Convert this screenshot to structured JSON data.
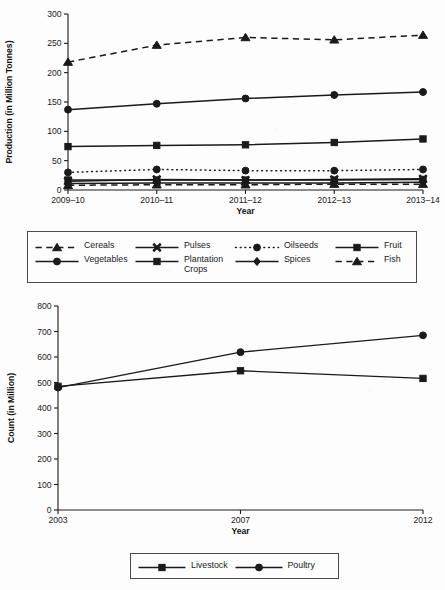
{
  "figure": {
    "background_color": "#fdfdfd",
    "ink_color": "#1a1a1a"
  },
  "chart_data": [
    {
      "id": "production-chart",
      "type": "line",
      "title": "",
      "xlabel": "Year",
      "ylabel": "Production (in Million Tonnes)",
      "categories": [
        "2009–10",
        "2010–11",
        "2011–12",
        "2012–13",
        "2013–14"
      ],
      "ylim": [
        0,
        300
      ],
      "yticks": [
        0,
        50,
        100,
        150,
        200,
        250,
        300
      ],
      "grid": false,
      "legend_position": "below-axes",
      "series": [
        {
          "name": "Cereals",
          "values": [
            218,
            247,
            260,
            256,
            264
          ],
          "marker": "triangle",
          "line_style": "dashed"
        },
        {
          "name": "Pulses",
          "values": [
            15,
            18,
            17,
            18,
            19
          ],
          "marker": "x",
          "line_style": "solid"
        },
        {
          "name": "Oilseeds",
          "values": [
            30,
            35,
            33,
            33,
            35
          ],
          "marker": "circle",
          "line_style": "dotted"
        },
        {
          "name": "Fruit",
          "values": [
            74,
            76,
            77,
            81,
            87
          ],
          "marker": "square",
          "line_style": "solid"
        },
        {
          "name": "Vegetables",
          "values": [
            137,
            147,
            156,
            162,
            167
          ],
          "marker": "circle",
          "line_style": "solid"
        },
        {
          "name": "Plantation Crops",
          "values": [
            17,
            17,
            17,
            17,
            18
          ],
          "marker": "square",
          "line_style": "solid"
        },
        {
          "name": "Spices",
          "values": [
            11,
            12,
            12,
            12,
            13
          ],
          "marker": "diamond",
          "line_style": "solid"
        },
        {
          "name": "Fish",
          "values": [
            8,
            9,
            9,
            10,
            10
          ],
          "marker": "triangle",
          "line_style": "dashed"
        }
      ]
    },
    {
      "id": "livestock-poultry-chart",
      "type": "line",
      "title": "",
      "xlabel": "Year",
      "ylabel": "Count (in Million)",
      "categories": [
        "2003",
        "2007",
        "2012"
      ],
      "ylim": [
        0,
        800
      ],
      "yticks": [
        0,
        100,
        200,
        300,
        400,
        500,
        600,
        700,
        800
      ],
      "grid": false,
      "legend_position": "below-axes",
      "series": [
        {
          "name": "Livestock",
          "values": [
            485,
            546,
            516
          ],
          "marker": "square",
          "line_style": "solid"
        },
        {
          "name": "Poultry",
          "values": [
            480,
            619,
            685
          ],
          "marker": "circle",
          "line_style": "solid"
        }
      ]
    }
  ],
  "legends": {
    "top": {
      "items": [
        {
          "label": "Cereals",
          "marker": "triangle",
          "line_style": "dashed"
        },
        {
          "label": "Pulses",
          "marker": "x",
          "line_style": "solid"
        },
        {
          "label": "Oilseeds",
          "marker": "circle",
          "line_style": "dotted"
        },
        {
          "label": "Fruit",
          "marker": "square",
          "line_style": "solid"
        },
        {
          "label": "Vegetables",
          "marker": "circle",
          "line_style": "solid"
        },
        {
          "label": "Plantation\nCrops",
          "marker": "square",
          "line_style": "solid"
        },
        {
          "label": "Spices",
          "marker": "diamond",
          "line_style": "solid"
        },
        {
          "label": "Fish",
          "marker": "triangle",
          "line_style": "dashed"
        }
      ]
    },
    "bottom": {
      "items": [
        {
          "label": "Livestock",
          "marker": "square",
          "line_style": "solid"
        },
        {
          "label": "Poultry",
          "marker": "circle",
          "line_style": "solid"
        }
      ]
    }
  }
}
